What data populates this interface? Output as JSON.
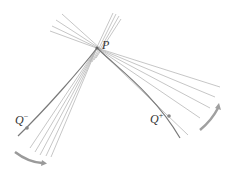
{
  "diagram": {
    "labels": {
      "p": "P",
      "q_minus_base": "Q",
      "q_minus_sup": "−",
      "q_plus_base": "Q",
      "q_plus_sup": "+"
    },
    "colors": {
      "lines": "#b5b5b5",
      "curve": "#777777",
      "arrow": "#999999",
      "point": "#888888"
    }
  }
}
